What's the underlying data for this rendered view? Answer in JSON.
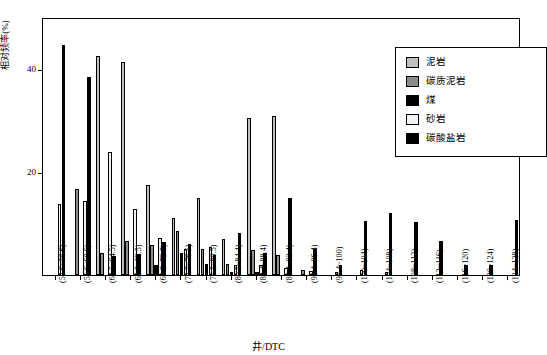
{
  "chart_data": {
    "type": "bar",
    "title": "",
    "xlabel": "井/DTC",
    "ylabel": "相对频率(%)",
    "ylim": [
      0,
      50
    ],
    "yticks": [
      20,
      40
    ],
    "grid": false,
    "legend_position": "top-right",
    "categories": [
      "(52.6~56.6)",
      "(56.6~60.6)",
      "(60.5~64.5)",
      "(64.5~68.5)",
      "(68.5~72.5)",
      "(72.5~76.5)",
      "(76.5~80.5)",
      "(80.5~84.4)",
      "(84.4~88.4)",
      "(88.4~92.4)",
      "(92.4~96.4)",
      "(96.4~100)",
      "(100~104)",
      "(104~108)",
      "(108~112)",
      "(112~116)",
      "(116~120)",
      "(120~124)",
      "(124~128)"
    ],
    "series": [
      {
        "name": "泥岩",
        "color": "#bfbfbf",
        "values": [
          0,
          0,
          42.5,
          41.2,
          17.5,
          11.0,
          14.9,
          7.0,
          30.5,
          30.8,
          0,
          0,
          0,
          0,
          0,
          0,
          0,
          0,
          0
        ]
      },
      {
        "name": "碳质泥岩",
        "color": "#8c8c8c",
        "values": [
          0,
          16.7,
          4.2,
          6.5,
          5.8,
          8.5,
          5.1,
          2.2,
          4.8,
          3.8,
          1.0,
          0,
          0,
          0,
          0,
          0,
          0,
          0,
          0
        ]
      },
      {
        "name": "煤",
        "color": "#000000",
        "values": [
          0,
          0,
          0,
          0,
          2.0,
          4.2,
          2.2,
          0.6,
          0.5,
          0,
          0,
          0,
          0,
          0,
          0,
          0,
          0,
          0,
          0
        ]
      },
      {
        "name": "砂岩",
        "color": "#f2f2f2",
        "values": [
          13.8,
          14.3,
          23.8,
          12.8,
          7.1,
          5.0,
          5.5,
          2.0,
          2.0,
          1.3,
          0.8,
          0.5,
          1.0,
          0.6,
          0,
          0,
          0,
          0,
          0
        ]
      },
      {
        "name": "碳酸盐岩",
        "color": "#000000",
        "values": [
          44.6,
          38.4,
          3.6,
          4.0,
          6.4,
          6.1,
          3.9,
          8.2,
          4.2,
          15.0,
          5.0,
          2.0,
          10.4,
          12.0,
          10.3,
          6.5,
          2.0,
          2.0,
          10.6
        ]
      }
    ],
    "legend_items": [
      {
        "label": "泥岩",
        "color": "#bfbfbf"
      },
      {
        "label": "碳质泥岩",
        "color": "#8c8c8c"
      },
      {
        "label": "煤",
        "color": "#000000"
      },
      {
        "label": "砂岩",
        "color": "#f2f2f2"
      },
      {
        "label": "碳酸盐岩",
        "color": "#000000"
      }
    ]
  }
}
